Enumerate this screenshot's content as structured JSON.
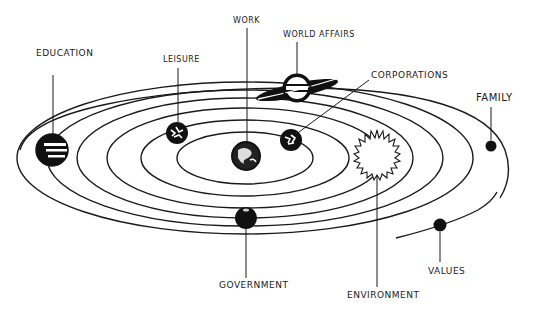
{
  "diagram": {
    "type": "solar-system metaphor",
    "stroke_color": "#1a1a1a",
    "background": "#ffffff",
    "center": {
      "x": 245,
      "y": 158
    },
    "orbits": [
      {
        "name": "orbit-1",
        "rx": 68,
        "ry": 26
      },
      {
        "name": "orbit-2",
        "rx": 104,
        "ry": 38
      },
      {
        "name": "orbit-3",
        "rx": 138,
        "ry": 50
      },
      {
        "name": "orbit-4",
        "rx": 168,
        "ry": 60
      },
      {
        "name": "orbit-5",
        "rx": 198,
        "ry": 68
      },
      {
        "name": "orbit-6",
        "rx": 228,
        "ry": 76
      }
    ],
    "planets": [
      {
        "id": "education",
        "label": "EDUCATION",
        "x": 52,
        "y": 150,
        "r": 16,
        "style": "striped",
        "label_x": 36,
        "label_y": 48
      },
      {
        "id": "leisure",
        "label": "LEISURE",
        "x": 177,
        "y": 133,
        "r": 11,
        "style": "textured",
        "label_x": 163,
        "label_y": 55
      },
      {
        "id": "work",
        "label": "WORK",
        "x": 246,
        "y": 156,
        "r": 14,
        "style": "earth",
        "label_x": 233,
        "label_y": 16
      },
      {
        "id": "world-affairs",
        "label": "WORLD AFFAIRS",
        "x": 297,
        "y": 88,
        "r": 14,
        "style": "ringed",
        "label_x": 283,
        "label_y": 30
      },
      {
        "id": "corporations",
        "label": "CORPORATIONS",
        "x": 291,
        "y": 140,
        "r": 11,
        "style": "textured",
        "label_x": 371,
        "label_y": 70
      },
      {
        "id": "environment",
        "label": "ENVIRONMENT",
        "x": 377,
        "y": 154,
        "r": 20,
        "style": "spiky",
        "label_x": 347,
        "label_y": 290
      },
      {
        "id": "government",
        "label": "GOVERNMENT",
        "x": 246,
        "y": 218,
        "r": 11,
        "style": "solid",
        "label_x": 219,
        "label_y": 280
      },
      {
        "id": "family",
        "label": "FAMILY",
        "x": 491,
        "y": 146,
        "r": 6,
        "style": "solid",
        "label_x": 476,
        "label_y": 93
      },
      {
        "id": "values",
        "label": "VALUES",
        "x": 440,
        "y": 225,
        "r": 7,
        "style": "solid",
        "label_x": 428,
        "label_y": 266
      }
    ]
  }
}
